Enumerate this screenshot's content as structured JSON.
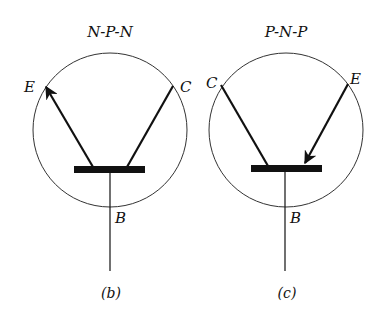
{
  "diagram": {
    "left": {
      "title": "N-P-N",
      "emitter_label": "E",
      "collector_label": "C",
      "base_label": "B",
      "caption": "(b)",
      "arrow_direction": "outward"
    },
    "right": {
      "title": "P-N-P",
      "emitter_label": "E",
      "collector_label": "C",
      "base_label": "B",
      "caption": "(c)",
      "arrow_direction": "inward"
    },
    "colors": {
      "stroke": "#111111",
      "background": "#ffffff"
    }
  }
}
